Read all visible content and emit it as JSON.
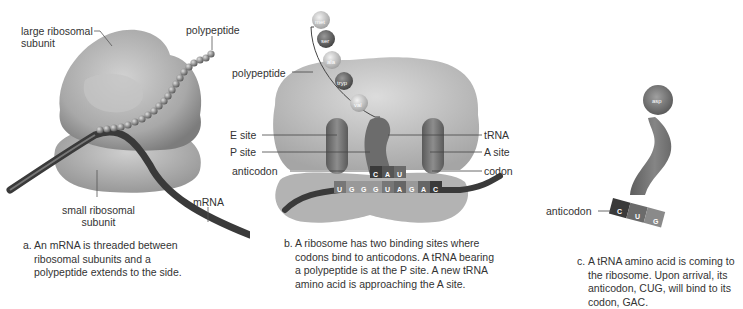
{
  "figure": {
    "panels": [
      {
        "id": "a",
        "labels": {
          "large_subunit": "large ribosomal\nsubunit",
          "large_subunit_line1": "large ribosomal",
          "large_subunit_line2": "subunit",
          "polypeptide": "polypeptide",
          "small_subunit_line1": "small ribosomal",
          "small_subunit_line2": "subunit",
          "mrna": "mRNA"
        },
        "caption_prefix": "a.",
        "caption": "An mRNA is threaded between ribosomal subunits and a polypeptide extends to the side."
      },
      {
        "id": "b",
        "labels": {
          "polypeptide": "polypeptide",
          "e_site": "E site",
          "p_site": "P site",
          "anticodon": "anticodon",
          "trna": "tRNA",
          "a_site": "A site",
          "codon": "codon"
        },
        "amino_acids": [
          "met",
          "ser",
          "ala",
          "tryp",
          "val"
        ],
        "anticodon_bases": [
          "C",
          "A",
          "U"
        ],
        "mrna_bases": [
          "U",
          "G",
          "G",
          "G",
          "U",
          "A",
          "G",
          "A",
          "C"
        ],
        "caption_prefix": "b.",
        "caption": "A ribosome has two binding sites where codons bind to anticodons. A tRNA bearing a polypeptide is at the P site. A new tRNA amino acid is approaching the A site."
      },
      {
        "id": "c",
        "labels": {
          "amino_acid": "asp",
          "anticodon": "anticodon"
        },
        "anticodon_bases": [
          "C",
          "U",
          "G"
        ],
        "caption_prefix": "c.",
        "caption": "A tRNA amino acid is coming to the ribosome. Upon arrival, its anticodon, CUG, will bind to its codon, GAC."
      }
    ],
    "colors": {
      "ribosome": "#b9b9b9",
      "ribosome_dark": "#8e8e8e",
      "mrna": "#3a3a3a",
      "trna": "#6f6f6f",
      "bead": "#8a8a8a",
      "text": "#333333",
      "leader": "#555555"
    }
  }
}
